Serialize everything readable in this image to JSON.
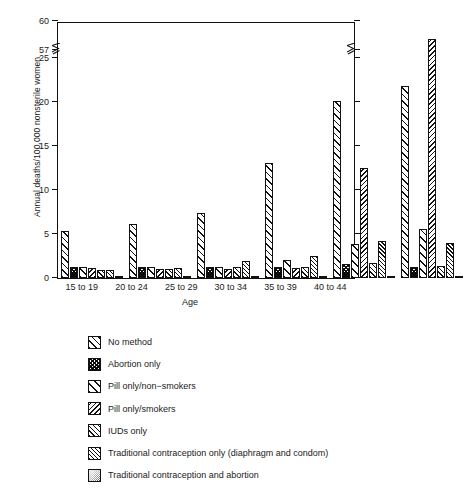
{
  "chart_data": {
    "type": "bar",
    "title": "",
    "xlabel": "Age",
    "ylabel": "Annual deaths/100,000 nonsterile women",
    "categories": [
      "15 to 19",
      "20 to 24",
      "25 to 29",
      "30 to 34",
      "35 to 39",
      "40 to 44"
    ],
    "yticks": [
      0,
      5,
      10,
      15,
      20,
      25,
      57,
      60
    ],
    "ytick_labels": [
      "0",
      "5",
      "10",
      "15",
      "20",
      "25",
      "57",
      "60"
    ],
    "ylim": [
      0,
      60
    ],
    "axis_break": {
      "present": true,
      "between": [
        25,
        57
      ],
      "note": "broken y-axis between 25 and 57"
    },
    "grid": false,
    "legend_position": "below-plot",
    "series": [
      {
        "name": "No method",
        "pattern": "diagonal-forward-wide",
        "values": [
          5.3,
          6.1,
          7.4,
          13.1,
          20.1,
          21.8
        ]
      },
      {
        "name": "Abortion only",
        "pattern": "crosshatch-dense-dark",
        "values": [
          1.2,
          1.3,
          1.2,
          1.3,
          1.6,
          1.2
        ]
      },
      {
        "name": "Pill only/non−smokers",
        "pattern": "diagonal-forward-sparse",
        "values": [
          1.3,
          1.3,
          1.2,
          2.0,
          3.9,
          5.6
        ]
      },
      {
        "name": "Pill only/smokers",
        "pattern": "diagonal-back",
        "values": [
          1.1,
          1.0,
          1.0,
          1.1,
          12.5,
          58.2
        ]
      },
      {
        "name": "IUDs only",
        "pattern": "crosshatch-light",
        "values": [
          0.9,
          1.0,
          1.3,
          1.2,
          1.7,
          1.4
        ]
      },
      {
        "name": "Traditional contraception only (diaphragm and condom)",
        "pattern": "diagonal-forward-tight",
        "values": [
          0.9,
          1.1,
          1.9,
          2.5,
          4.2,
          4.0
        ]
      },
      {
        "name": "Traditional contraception and abortion",
        "pattern": "stipple-gray",
        "values": [
          0.2,
          0.2,
          0.2,
          0.2,
          0.2,
          0.2
        ]
      }
    ]
  },
  "axes": {
    "ylabel": "Annual deaths/100,000 nonsterile women",
    "xlabel": "Age"
  },
  "legend": {
    "items": [
      {
        "label": "No method"
      },
      {
        "label": "Abortion only"
      },
      {
        "label": "Pill only/non−smokers"
      },
      {
        "label": "Pill only/smokers"
      },
      {
        "label": "IUDs only"
      },
      {
        "label": "Traditional contraception only (diaphragm and condom)"
      },
      {
        "label": "Traditional contraception and abortion"
      }
    ]
  }
}
